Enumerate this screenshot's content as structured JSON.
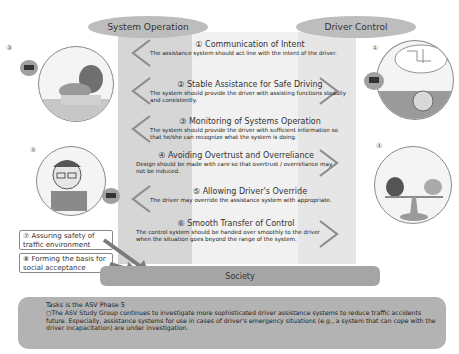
{
  "columns": {
    "left_header": "System Operation",
    "right_header": "Driver Control"
  },
  "principles": [
    {
      "number": "①",
      "title": "Communication of Intent",
      "body": "The assistance system should act line with the intent of the driver.",
      "direction": "left"
    },
    {
      "number": "②",
      "title": "Stable Assistance for Safe Driving",
      "body": "The system should provide the driver with assisting functions steadily and consistently.",
      "direction": "both"
    },
    {
      "number": "③",
      "title": "Monitoring of Systems Operation",
      "body": "The system should provide the driver with sufficient information so that he/she can recognize what the system is doing.",
      "direction": "left"
    },
    {
      "number": "④",
      "title": "Avoiding Overtrust and Overreliance",
      "body": "Design should be made with care so that overtrust / overreliance may not be induced.",
      "direction": "right"
    },
    {
      "number": "⑤",
      "title": "Allowing Driver's Override",
      "body": "The driver may override the assistance system with appropriate.",
      "direction": "left"
    },
    {
      "number": "⑥",
      "title": "Smooth Transfer of Control",
      "body": "The control system should be handed over smoothly to the driver when the situation goes beyond the range of the system.",
      "direction": "right"
    }
  ],
  "side_boxes": [
    {
      "number": "⑦",
      "text": "Assuring safety of traffic environment"
    },
    {
      "number": "⑧",
      "text": "Forming the basis for social acceptance"
    }
  ],
  "illustrations": {
    "left_top_label": "③",
    "left_mid_label": "⑤",
    "right_top_label": "①",
    "right_mid_label": "④"
  },
  "society": {
    "label": "Society"
  },
  "tasks": {
    "title": "Tasks is the ASV Phase 5",
    "body": "○The ASV Study Group continues to investigate more sophisticated driver assistance systems to reduce traffic accidents future. Especially, assistance systems for use in cases of driver's emergency situations (e.g., a system that can cope with the driver incapacitation) are under investigation."
  },
  "colors": {
    "oval": "#bdbdbd",
    "society_bar": "#a5a5a5",
    "tasks_box": "#b3b3b3",
    "chevron": "#8c8c8c",
    "arrow": "#7a7a7a"
  }
}
